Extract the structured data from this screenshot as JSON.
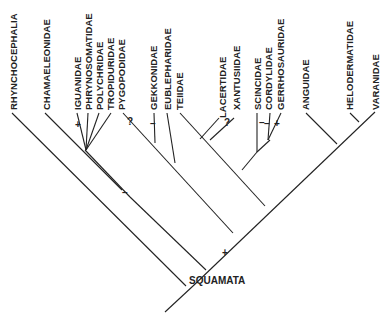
{
  "diagram": {
    "type": "cladogram",
    "root_label": "SQUAMATA",
    "taxa": [
      "RHYNCHOCEPHALIA",
      "CHAMAELEONIDAE",
      "IGUANIDAE",
      "PHRYNOSOMATIDAE",
      "POLYCHRIDAE",
      "TROPIDURIDAE",
      "PYGOPODIDAE",
      "GEKKONIDAE",
      "EUBLEPHARIDAE",
      "TEIIDAE",
      "LACERTIDAE",
      "XANTUSIIDAE",
      "SCINCIDAE",
      "CORDYLIDAE",
      "GERRHOSAURIDAE",
      "ANGUIDAE",
      "HELODERMATIDAE",
      "VARANIDAE"
    ],
    "marks": {
      "iguanidae": "+",
      "pygopodidae": "?",
      "gekkonidae": "–",
      "xantusiidae": "?",
      "scincidae": "–",
      "cordylidae": "–",
      "gerrhosauridae": "+",
      "chamaeleonidae_stem": "–",
      "squamata_stem": "+"
    }
  }
}
